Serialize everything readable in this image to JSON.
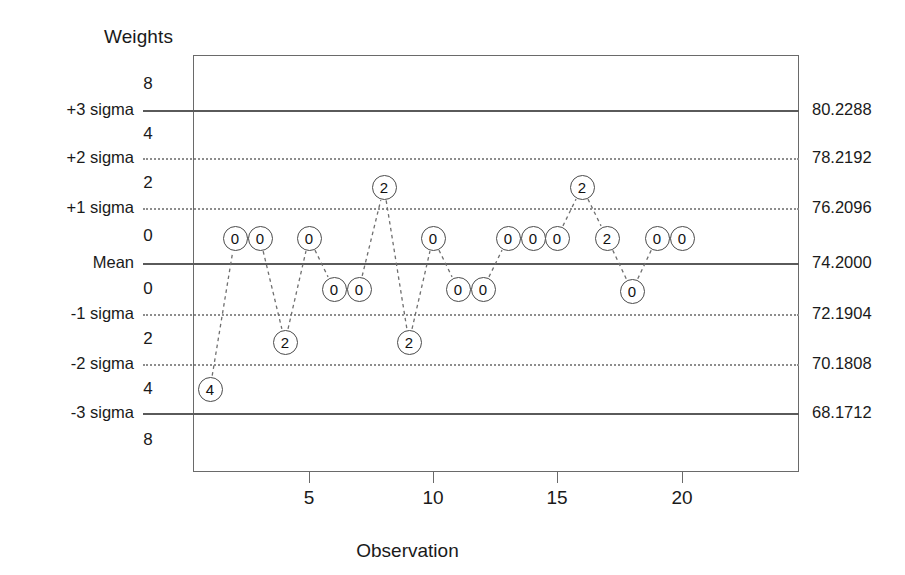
{
  "axes": {
    "y_title": "Weights",
    "x_title": "Observation",
    "x_ticks": [
      {
        "label": "5",
        "value": 5
      },
      {
        "label": "10",
        "value": 10
      },
      {
        "label": "15",
        "value": 15
      },
      {
        "label": "20",
        "value": 20
      }
    ]
  },
  "limits": [
    {
      "name": "+3 sigma",
      "label": "+3 sigma",
      "value": "80.2288",
      "style": "solid",
      "y": 110
    },
    {
      "name": "+2 sigma",
      "label": "+2 sigma",
      "value": "78.2192",
      "style": "dotted",
      "y": 158
    },
    {
      "name": "+1 sigma",
      "label": "+1 sigma",
      "value": "76.2096",
      "style": "dotted",
      "y": 208
    },
    {
      "name": "mean",
      "label": "Mean",
      "value": "74.2000",
      "style": "solid",
      "y": 263
    },
    {
      "name": "-1 sigma",
      "label": "-1 sigma",
      "value": "72.1904",
      "style": "dotted",
      "y": 314
    },
    {
      "name": "-2 sigma",
      "label": "-2 sigma",
      "value": "70.1808",
      "style": "dotted",
      "y": 364
    },
    {
      "name": "-3 sigma",
      "label": "-3 sigma",
      "value": "68.1712",
      "style": "solid",
      "y": 413
    }
  ],
  "zone_weights": [
    {
      "label": "8",
      "y": 84
    },
    {
      "label": "4",
      "y": 134
    },
    {
      "label": "2",
      "y": 183
    },
    {
      "label": "0",
      "y": 236
    },
    {
      "label": "0",
      "y": 289
    },
    {
      "label": "2",
      "y": 339
    },
    {
      "label": "4",
      "y": 389
    },
    {
      "label": "8",
      "y": 440
    }
  ],
  "chart_data": {
    "type": "scatter",
    "title": "",
    "xlabel": "Observation",
    "ylabel": "Weights",
    "xlim": [
      0.4,
      20.6
    ],
    "ylim": [
      66.5,
      81.9
    ],
    "grid": true,
    "legend": false,
    "point_label_meaning": "zone weight",
    "center_line": 74.2,
    "sigma": 2.0096,
    "control_limits": {
      "ucl": 80.2288,
      "plus_2_sigma": 78.2192,
      "plus_1_sigma": 76.2096,
      "mean": 74.2,
      "minus_1_sigma": 72.1904,
      "minus_2_sigma": 70.1808,
      "lcl": 68.1712
    },
    "x": [
      1,
      2,
      3,
      4,
      5,
      6,
      7,
      8,
      9,
      10,
      11,
      12,
      13,
      14,
      15,
      16,
      17,
      18,
      19,
      20
    ],
    "point_labels": [
      "4",
      "0",
      "0",
      "2",
      "0",
      "0",
      "0",
      "2",
      "2",
      "0",
      "0",
      "0",
      "0",
      "0",
      "0",
      "2",
      "2",
      "0",
      "0",
      "0"
    ],
    "points": [
      {
        "x": 1,
        "label": "4",
        "px": 210,
        "py": 389
      },
      {
        "x": 2,
        "label": "0",
        "px": 235,
        "py": 238
      },
      {
        "x": 3,
        "label": "0",
        "px": 260,
        "py": 238
      },
      {
        "x": 4,
        "label": "2",
        "px": 285,
        "py": 342
      },
      {
        "x": 5,
        "label": "0",
        "px": 309,
        "py": 238
      },
      {
        "x": 6,
        "label": "0",
        "px": 334,
        "py": 289
      },
      {
        "x": 7,
        "label": "0",
        "px": 359,
        "py": 289
      },
      {
        "x": 8,
        "label": "2",
        "px": 384,
        "py": 187
      },
      {
        "x": 9,
        "label": "2",
        "px": 409,
        "py": 342
      },
      {
        "x": 10,
        "label": "0",
        "px": 433,
        "py": 238
      },
      {
        "x": 11,
        "label": "0",
        "px": 458,
        "py": 289
      },
      {
        "x": 12,
        "label": "0",
        "px": 483,
        "py": 289
      },
      {
        "x": 13,
        "label": "0",
        "px": 508,
        "py": 238
      },
      {
        "x": 14,
        "label": "0",
        "px": 533,
        "py": 238
      },
      {
        "x": 15,
        "label": "0",
        "px": 557,
        "py": 238
      },
      {
        "x": 16,
        "label": "2",
        "px": 582,
        "py": 187
      },
      {
        "x": 17,
        "label": "2",
        "px": 607,
        "py": 238
      },
      {
        "x": 18,
        "label": "0",
        "px": 632,
        "py": 291
      },
      {
        "x": 19,
        "label": "0",
        "px": 657,
        "py": 238
      },
      {
        "x": 20,
        "label": "0",
        "px": 682,
        "py": 238
      }
    ]
  },
  "colors": {
    "line": "#5a5a5a",
    "dotted": "#8d8d8d",
    "frame": "#6a6a6a",
    "point_stroke": "#4b4b4b",
    "text": "#1a1a1a"
  }
}
